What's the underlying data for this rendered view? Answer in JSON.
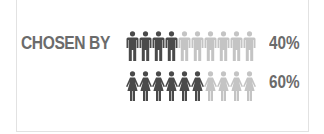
{
  "label": "CHOSEN BY",
  "colors": {
    "filled": "#4a4a4a",
    "empty": "#c4c4c4",
    "text": "#6b6b6b"
  },
  "rows": [
    {
      "icon": "man-icon",
      "filled": 4,
      "total": 10,
      "percent_label": "40%"
    },
    {
      "icon": "woman-icon",
      "filled": 6,
      "total": 10,
      "percent_label": "60%"
    }
  ],
  "chart_data": {
    "type": "pictogram",
    "title": "CHOSEN BY",
    "categories": [
      "Men",
      "Women"
    ],
    "values": [
      40,
      60
    ],
    "value_labels": [
      "40%",
      "60%"
    ],
    "icons_per_row": 10,
    "filled_icons": [
      4,
      6
    ]
  }
}
